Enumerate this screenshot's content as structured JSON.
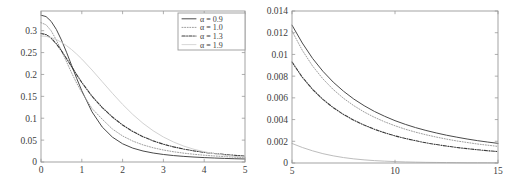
{
  "figure": {
    "title": "",
    "background": "#ffffff",
    "axis_color": "#9a9a9a",
    "text_color": "#3d3d3d"
  },
  "legend": {
    "position": "top-right-of-left-panel",
    "entries": [
      {
        "label": "α = 0.9",
        "style": "solid",
        "color": "#4a4a4a",
        "width": 1.0
      },
      {
        "label": "α = 1.0",
        "style": "dotted",
        "color": "#9e9e9e",
        "width": 1.0
      },
      {
        "label": "α = 1.3",
        "style": "dashdot",
        "color": "#3a3a3a",
        "width": 1.1
      },
      {
        "label": "α = 1.9",
        "style": "solid",
        "color": "#d2d2d2",
        "width": 0.9
      }
    ]
  },
  "chart_data": [
    {
      "type": "line",
      "title": "",
      "xlabel": "",
      "ylabel": "",
      "xlim": [
        0,
        5
      ],
      "ylim": [
        0,
        0.345
      ],
      "grid": false,
      "box": true,
      "legend_position": "upper right",
      "xticks": [
        0,
        1,
        2,
        3,
        4,
        5
      ],
      "xticklabels": [
        "0",
        "1",
        "2",
        "3",
        "4",
        "5"
      ],
      "yticks": [
        0,
        0.05,
        0.1,
        0.15,
        0.2,
        0.25,
        0.3
      ],
      "yticklabels": [
        "0",
        "0.05",
        "0.1",
        "0.15",
        "0.2",
        "0.25",
        "0.3"
      ],
      "x": [
        0,
        0.125,
        0.25,
        0.375,
        0.5,
        0.625,
        0.75,
        0.875,
        1,
        1.25,
        1.5,
        1.75,
        2,
        2.25,
        2.5,
        2.75,
        3,
        3.25,
        3.5,
        3.75,
        4,
        4.25,
        4.5,
        4.75,
        5
      ],
      "series": [
        {
          "name": "α = 0.9",
          "style": "solid",
          "color": "#4a4a4a",
          "values": [
            0.3355,
            0.3322,
            0.3212,
            0.303,
            0.2789,
            0.2508,
            0.2208,
            0.1909,
            0.1627,
            0.1146,
            0.08,
            0.0568,
            0.0416,
            0.0317,
            0.0251,
            0.0205,
            0.0172,
            0.0147,
            0.0128,
            0.0113,
            0.0101,
            0.0091,
            0.0082,
            0.0075,
            0.0069
          ]
        },
        {
          "name": "α = 1.0",
          "style": "dotted",
          "color": "#9e9e9e",
          "values": [
            0.3183,
            0.3134,
            0.2996,
            0.2788,
            0.2546,
            0.2292,
            0.2037,
            0.18,
            0.1592,
            0.1222,
            0.0979,
            0.0753,
            0.0595,
            0.0478,
            0.0391,
            0.0325,
            0.0274,
            0.0234,
            0.0202,
            0.0176,
            0.0155,
            0.0138,
            0.0123,
            0.011,
            0.01
          ]
        },
        {
          "name": "α = 1.3",
          "style": "dashdot",
          "color": "#3a3a3a",
          "values": [
            0.2938,
            0.291,
            0.2829,
            0.2702,
            0.2543,
            0.2365,
            0.2179,
            0.1994,
            0.1817,
            0.1502,
            0.1244,
            0.1028,
            0.0845,
            0.0697,
            0.0578,
            0.0483,
            0.0406,
            0.0345,
            0.0295,
            0.0254,
            0.0221,
            0.0194,
            0.0171,
            0.0152,
            0.0136
          ]
        },
        {
          "name": "α = 1.9",
          "style": "solid",
          "color": "#d2d2d2",
          "values": [
            0.2879,
            0.287,
            0.2843,
            0.2798,
            0.2736,
            0.2659,
            0.2568,
            0.2465,
            0.2352,
            0.2102,
            0.1836,
            0.157,
            0.1316,
            0.1086,
            0.0884,
            0.0713,
            0.0571,
            0.0456,
            0.0363,
            0.029,
            0.0234,
            0.019,
            0.0156,
            0.013,
            0.011
          ]
        }
      ]
    },
    {
      "type": "line",
      "title": "",
      "xlabel": "",
      "ylabel": "",
      "xlim": [
        5,
        15
      ],
      "ylim": [
        0,
        0.014
      ],
      "grid": false,
      "box": true,
      "legend_position": "none",
      "xticks": [
        5,
        10,
        15
      ],
      "xticklabels": [
        "5",
        "10",
        "15"
      ],
      "yticks": [
        0,
        0.002,
        0.004,
        0.006,
        0.008,
        0.01,
        0.012,
        0.014
      ],
      "yticklabels": [
        "0",
        "0.002",
        "0.004",
        "0.006",
        "0.008",
        "0.01",
        "0.012",
        "0.014"
      ],
      "x": [
        5,
        5.5,
        6,
        6.5,
        7,
        7.5,
        8,
        8.5,
        9,
        9.5,
        10,
        10.5,
        11,
        11.5,
        12,
        12.5,
        13,
        13.5,
        14,
        14.5,
        15
      ],
      "series": [
        {
          "name": "α = 0.9",
          "style": "solid",
          "color": "#4a4a4a",
          "values": [
            0.0127,
            0.01105,
            0.00963,
            0.00845,
            0.00745,
            0.00661,
            0.00589,
            0.00528,
            0.00475,
            0.0043,
            0.0039,
            0.00356,
            0.00326,
            0.003,
            0.00277,
            0.00256,
            0.00238,
            0.00221,
            0.00206,
            0.00193,
            0.00181
          ]
        },
        {
          "name": "α = 1.0",
          "style": "dotted",
          "color": "#9e9e9e",
          "values": [
            0.01215,
            0.01038,
            0.00893,
            0.00775,
            0.00677,
            0.00596,
            0.00528,
            0.0047,
            0.00421,
            0.00379,
            0.00343,
            0.00311,
            0.00284,
            0.0026,
            0.00239,
            0.0022,
            0.00203,
            0.00189,
            0.00175,
            0.00164,
            0.00153
          ]
        },
        {
          "name": "α = 1.3",
          "style": "dashdot",
          "color": "#3a3a3a",
          "values": [
            0.0093,
            0.0079,
            0.00678,
            0.00586,
            0.0051,
            0.00447,
            0.00394,
            0.00349,
            0.00311,
            0.00278,
            0.0025,
            0.00226,
            0.00205,
            0.00186,
            0.0017,
            0.00156,
            0.00143,
            0.00132,
            0.00122,
            0.00113,
            0.00105
          ]
        },
        {
          "name": "α = 1.9",
          "style": "solid",
          "color": "#bdbdbd",
          "values": [
            0.0018,
            0.00143,
            0.00112,
            0.00086,
            0.00066,
            0.0005,
            0.00038,
            0.00029,
            0.00022,
            0.00017,
            0.00013,
            0.0001,
            8e-05,
            6e-05,
            5e-05,
            4e-05,
            3e-05,
            2e-05,
            2e-05,
            2e-05,
            1e-05
          ]
        }
      ]
    }
  ]
}
